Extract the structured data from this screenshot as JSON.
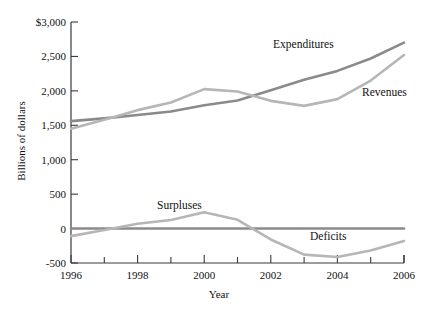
{
  "chart_data": {
    "type": "line",
    "title": "",
    "xlabel": "Year",
    "ylabel": "Billions of dollars",
    "xlim": [
      1996,
      2006
    ],
    "ylim": [
      -500,
      3000
    ],
    "grid": false,
    "legend_position": "inline-annotations",
    "x_ticks_major": [
      "1996",
      "1998",
      "2000",
      "2002",
      "2004",
      "2006"
    ],
    "x_ticks_minor": [
      "1997",
      "1999",
      "2001",
      "2003",
      "2005"
    ],
    "y_ticks": [
      "$3,000",
      "2,500",
      "2,000",
      "1,500",
      "1,000",
      "500",
      "0",
      "-500"
    ],
    "y_tick_values": [
      3000,
      2500,
      2000,
      1500,
      1000,
      500,
      0,
      -500
    ],
    "x": [
      1996,
      1997,
      1998,
      1999,
      2000,
      2001,
      2002,
      2003,
      2004,
      2005,
      2006
    ],
    "series": [
      {
        "name": "Expenditures",
        "color": "#8a8a8a",
        "label_x": 273,
        "label_y": 44,
        "values": [
          1560,
          1600,
          1650,
          1700,
          1790,
          1860,
          2010,
          2160,
          2290,
          2470,
          2700
        ]
      },
      {
        "name": "Revenues",
        "color": "#b6b6b6",
        "label_x": 362,
        "label_y": 92,
        "values": [
          1450,
          1580,
          1720,
          1830,
          2025,
          1990,
          1855,
          1782,
          1880,
          2150,
          2520
        ]
      },
      {
        "name": "Surpluses",
        "color": "#b6b6b6",
        "label_x": 186,
        "label_y": 206,
        "values": [
          -110,
          -22,
          70,
          125,
          236,
          128,
          -158,
          -378,
          -412,
          -318,
          -180
        ]
      },
      {
        "name": "Deficits",
        "color": "#b6b6b6",
        "label_x": 333,
        "label_y": 236,
        "values": [
          -110,
          -22,
          70,
          125,
          236,
          128,
          -158,
          -378,
          -412,
          -318,
          -180
        ]
      },
      {
        "name": "Zero baseline",
        "color": "#8a8a8a",
        "label_x": null,
        "label_y": null,
        "values": [
          0,
          0,
          0,
          0,
          0,
          0,
          0,
          0,
          0,
          0,
          0
        ]
      }
    ]
  },
  "axes": {
    "x_axis_label": "Year",
    "y_axis_label": "Billions of dollars"
  }
}
